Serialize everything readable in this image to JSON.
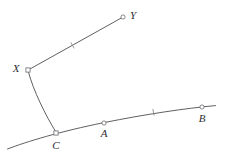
{
  "figure": {
    "background_color": "#ffffff",
    "stroke_color": "#4e4e52",
    "label_color": "#2d2d31",
    "tick_color": "#8d8d92",
    "marker_stroke_color": "#6a6a70",
    "width": 226,
    "height": 157
  },
  "points": [
    {
      "id": "X",
      "label": "X",
      "x": 28,
      "y": 70,
      "label_x": 16,
      "label_y": 69,
      "marker": "square"
    },
    {
      "id": "Y",
      "label": "Y",
      "x": 123,
      "y": 17,
      "label_x": 133,
      "label_y": 16,
      "marker": "circle"
    },
    {
      "id": "C",
      "label": "C",
      "x": 56,
      "y": 133,
      "label_x": 56,
      "label_y": 146,
      "marker": "square"
    },
    {
      "id": "A",
      "label": "A",
      "x": 104,
      "y": 123,
      "label_x": 104,
      "label_y": 134,
      "marker": "circle"
    },
    {
      "id": "B",
      "label": "B",
      "x": 202,
      "y": 107,
      "label_x": 202,
      "label_y": 119,
      "marker": "circle"
    }
  ],
  "paths": [
    {
      "id": "segment-XY",
      "kind": "segment",
      "from": "X",
      "to": "Y",
      "d": "M 29.6 69.2 L 122.0 17.6"
    },
    {
      "id": "arc-XC",
      "kind": "arc",
      "from": "X",
      "to": "C",
      "d": "M 28.6 72.4 C 33.0 90.0 46.0 116.0 55.4 131.2"
    },
    {
      "id": "arc-CAB",
      "kind": "arc",
      "from": "C",
      "to": "B",
      "d": "M 7.5 149.0 C 27.0 141.5 60.0 131.5 104.0 122.6 C 146.0 114.2 186.0 108.2 215.5 105.6"
    }
  ],
  "tick_marks": [
    {
      "id": "tick-XY",
      "on_path": "segment-XY",
      "x": 72.5,
      "y": 45.4,
      "angle_deg": -29.2,
      "length": 6
    },
    {
      "id": "tick-CAB",
      "on_path": "arc-CAB",
      "x": 153.5,
      "y": 112.3,
      "angle_deg": -10.5,
      "length": 6
    }
  ],
  "notes": {
    "tick_meaning": "single tick mark indicating equal measure",
    "marker_radius": 2.1
  }
}
